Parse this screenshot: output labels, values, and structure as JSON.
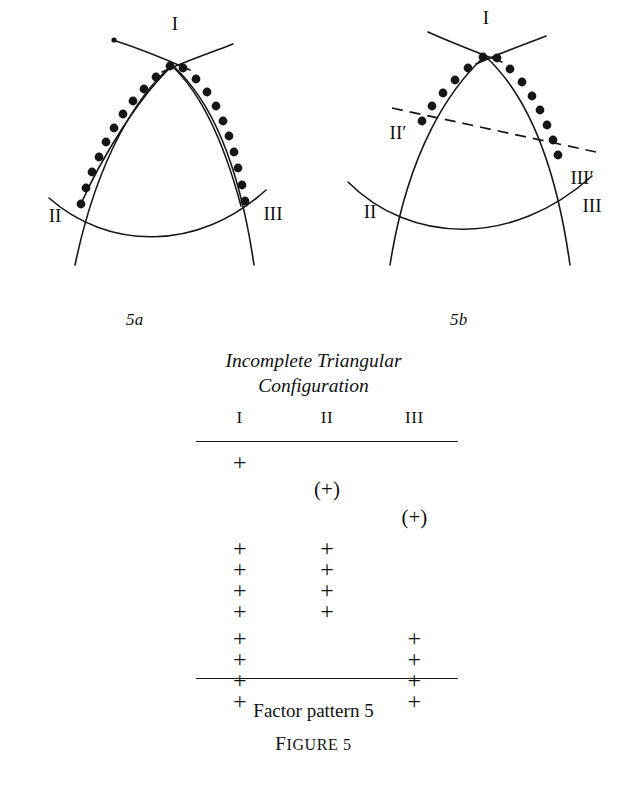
{
  "figure": {
    "main_caption_line1": "Incomplete Triangular",
    "main_caption_line2": "Configuration",
    "pattern_caption": "Factor pattern 5",
    "figure_label_first": "F",
    "figure_label_rest": "IGURE 5"
  },
  "diagram_a": {
    "sublabel": "5a",
    "labels": {
      "apex": "I",
      "left": "II",
      "right": "III"
    },
    "dot_count": 23,
    "stroke_color": "#161616"
  },
  "diagram_b": {
    "sublabel": "5b",
    "labels": {
      "apex": "I",
      "left": "II",
      "right": "III",
      "left_prime": "II′",
      "right_prime": "III′"
    },
    "dot_count": 15,
    "dashed_line": true,
    "stroke_color": "#161616"
  },
  "table": {
    "columns": [
      "I",
      "II",
      "III"
    ],
    "rows": [
      [
        "+",
        "",
        ""
      ],
      [
        "",
        "(+)",
        ""
      ],
      [
        "",
        "",
        "(+)"
      ],
      [
        "+",
        "+",
        ""
      ],
      [
        "+",
        "+",
        ""
      ],
      [
        "+",
        "+",
        ""
      ],
      [
        "+",
        "+",
        ""
      ],
      [
        "+",
        "",
        "+"
      ],
      [
        "+",
        "",
        "+"
      ],
      [
        "+",
        "",
        "+"
      ],
      [
        "+",
        "",
        "+"
      ]
    ],
    "row_offsets": [
      10,
      37,
      65,
      96,
      117,
      138,
      159,
      186,
      207,
      228,
      249
    ]
  }
}
